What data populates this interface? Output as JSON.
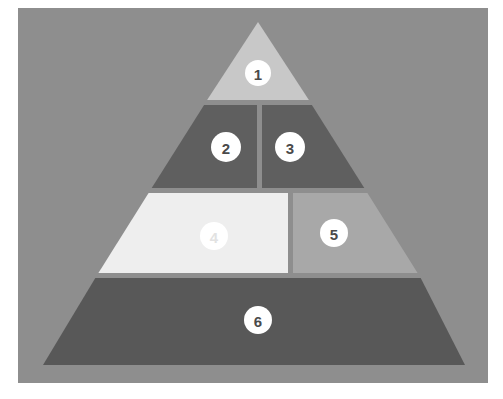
{
  "diagram": {
    "type": "segmented-pyramid",
    "background_color": "#ffffff",
    "panel_color": "#8e8e8e",
    "divider_color": "#ffffff",
    "badge_fill": "#ffffff",
    "badge_text_color": "#4a4a4a",
    "apex": {
      "x": 258,
      "y": 22
    },
    "base_left": {
      "x": 43,
      "y": 365
    },
    "base_right": {
      "x": 465,
      "y": 365
    },
    "levels": [
      {
        "level": 1,
        "label": "1",
        "color": "#c8c8c8",
        "shape": "apex-triangle",
        "top": 22,
        "bottom": 100,
        "badge": {
          "cx": 258,
          "cy": 73,
          "r": 13
        }
      },
      {
        "level": 2,
        "label": "2",
        "color": "#5f5f5f",
        "shape": "left-trapezoid",
        "top": 105,
        "bottom": 188,
        "split_x": 257,
        "badge": {
          "cx": 226,
          "cy": 147,
          "r": 15
        }
      },
      {
        "level": 2,
        "label": "3",
        "color": "#5f5f5f",
        "shape": "right-trapezoid",
        "top": 105,
        "bottom": 188,
        "split_x": 262,
        "badge": {
          "cx": 290,
          "cy": 147,
          "r": 15
        }
      },
      {
        "level": 3,
        "label": "4",
        "color": "#eeeeee",
        "shape": "left-trapezoid",
        "top": 193,
        "bottom": 273,
        "split_x": 288,
        "badge": {
          "cx": 214,
          "cy": 236,
          "r": 14
        }
      },
      {
        "level": 3,
        "label": "5",
        "color": "#a8a8a8",
        "shape": "right-trapezoid",
        "top": 193,
        "bottom": 273,
        "split_x": 293,
        "badge": {
          "cx": 334,
          "cy": 233,
          "r": 14
        }
      },
      {
        "level": 4,
        "label": "6",
        "color": "#585858",
        "shape": "base-trapezoid",
        "top": 278,
        "bottom": 365,
        "badge": {
          "cx": 258,
          "cy": 320,
          "r": 14
        }
      }
    ]
  }
}
